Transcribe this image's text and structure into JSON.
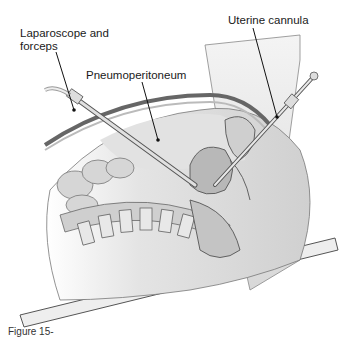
{
  "diagram": {
    "type": "medical-illustration",
    "labels": [
      {
        "id": "laparoscope",
        "text_line1": "Laparoscope and",
        "text_line2": "forceps"
      },
      {
        "id": "pneumoperitoneum",
        "text": "Pneumoperitoneum"
      },
      {
        "id": "uterine-cannula",
        "text": "Uterine cannula"
      }
    ],
    "caption_fragment": "Figure 15-",
    "colors": {
      "tissue_light": "#e6e6e6",
      "tissue_mid": "#c8c8c8",
      "tissue_dark": "#9a9a9a",
      "outline": "#555555",
      "leader": "#111111"
    }
  }
}
